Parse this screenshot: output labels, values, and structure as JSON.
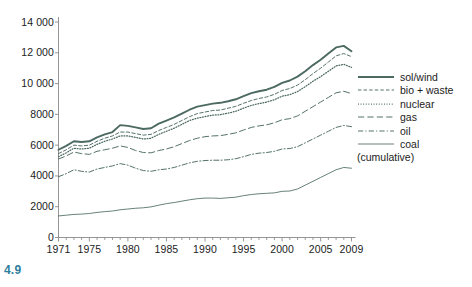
{
  "figure": {
    "number": "4.9",
    "number_color": "#2d7f9d",
    "line_color": "#4c6a62",
    "axis_color": "#8a8a8a",
    "text_color": "#1c1c1c"
  },
  "legend": {
    "position": "right",
    "note": "(cumulative)",
    "entries": [
      {
        "label": "sol/wind",
        "style": "solid-thick"
      },
      {
        "label": "bio + waste",
        "style": "dashed"
      },
      {
        "label": "nuclear",
        "style": "dotted"
      },
      {
        "label": "gas",
        "style": "long-dash"
      },
      {
        "label": "oil",
        "style": "dash-dot"
      },
      {
        "label": "coal",
        "style": "solid-thin"
      }
    ]
  },
  "chart_data": {
    "type": "line",
    "title": "",
    "subtitle": "",
    "xlabel": "",
    "ylabel": "",
    "cumulative": true,
    "grid": false,
    "legend_position": "right",
    "xlim": [
      1971,
      2009
    ],
    "ylim": [
      0,
      14000
    ],
    "yticks": [
      0,
      2000,
      4000,
      6000,
      8000,
      10000,
      12000,
      14000
    ],
    "ytick_labels": [
      "0",
      "2000",
      "4000",
      "6000",
      "8000",
      "10 000",
      "12 000",
      "14 000"
    ],
    "xticks": [
      1971,
      1975,
      1980,
      1985,
      1990,
      1995,
      2000,
      2005,
      2009
    ],
    "xtick_labels": [
      "1971",
      "1975",
      "1980",
      "1985",
      "1990",
      "1995",
      "2000",
      "2005",
      "2009"
    ],
    "x": [
      1971,
      1972,
      1973,
      1974,
      1975,
      1976,
      1977,
      1978,
      1979,
      1980,
      1981,
      1982,
      1983,
      1984,
      1985,
      1986,
      1987,
      1988,
      1989,
      1990,
      1991,
      1992,
      1993,
      1994,
      1995,
      1996,
      1997,
      1998,
      1999,
      2000,
      2001,
      2002,
      2003,
      2004,
      2005,
      2006,
      2007,
      2008,
      2009
    ],
    "series": [
      {
        "name": "coal",
        "style": "solid-thin",
        "values": [
          1400,
          1450,
          1500,
          1520,
          1560,
          1630,
          1680,
          1720,
          1800,
          1850,
          1900,
          1930,
          1990,
          2100,
          2200,
          2270,
          2360,
          2450,
          2520,
          2560,
          2560,
          2540,
          2580,
          2620,
          2720,
          2790,
          2840,
          2870,
          2900,
          3000,
          3020,
          3150,
          3400,
          3650,
          3900,
          4150,
          4400,
          4550,
          4500
        ]
      },
      {
        "name": "oil",
        "style": "dash-dot",
        "values": [
          3950,
          4150,
          4400,
          4300,
          4250,
          4450,
          4550,
          4650,
          4800,
          4700,
          4500,
          4350,
          4300,
          4400,
          4450,
          4550,
          4700,
          4850,
          4950,
          5000,
          5020,
          5020,
          5050,
          5120,
          5250,
          5400,
          5480,
          5520,
          5600,
          5750,
          5780,
          5900,
          6150,
          6400,
          6650,
          6900,
          7150,
          7280,
          7200
        ]
      },
      {
        "name": "gas",
        "style": "long-dash",
        "values": [
          5100,
          5300,
          5550,
          5450,
          5400,
          5600,
          5700,
          5800,
          5950,
          5850,
          5650,
          5520,
          5500,
          5650,
          5750,
          5900,
          6100,
          6300,
          6450,
          6550,
          6600,
          6620,
          6700,
          6800,
          6980,
          7150,
          7250,
          7320,
          7450,
          7650,
          7720,
          7900,
          8200,
          8500,
          8800,
          9100,
          9400,
          9500,
          9350
        ]
      },
      {
        "name": "nuclear",
        "style": "dotted",
        "values": [
          5250,
          5500,
          5800,
          5750,
          5800,
          6050,
          6250,
          6400,
          6600,
          6600,
          6500,
          6400,
          6450,
          6700,
          6900,
          7100,
          7350,
          7600,
          7750,
          7850,
          7950,
          7980,
          8080,
          8200,
          8400,
          8580,
          8700,
          8800,
          8950,
          9180,
          9280,
          9480,
          9800,
          10150,
          10450,
          10800,
          11150,
          11250,
          11050
        ]
      },
      {
        "name": "bio + waste",
        "style": "dashed",
        "values": [
          5450,
          5700,
          6000,
          5950,
          6000,
          6250,
          6450,
          6600,
          6850,
          6850,
          6750,
          6650,
          6700,
          6950,
          7150,
          7350,
          7600,
          7850,
          8050,
          8150,
          8250,
          8280,
          8400,
          8520,
          8720,
          8900,
          9030,
          9130,
          9300,
          9550,
          9680,
          9900,
          10250,
          10650,
          11000,
          11400,
          11800,
          11950,
          11750
        ]
      },
      {
        "name": "sol/wind",
        "style": "solid-thick",
        "values": [
          5700,
          5950,
          6250,
          6200,
          6250,
          6500,
          6700,
          6850,
          7300,
          7250,
          7150,
          7050,
          7100,
          7400,
          7600,
          7800,
          8050,
          8300,
          8500,
          8600,
          8700,
          8750,
          8850,
          8980,
          9180,
          9380,
          9500,
          9600,
          9780,
          10050,
          10200,
          10450,
          10800,
          11200,
          11550,
          11950,
          12350,
          12450,
          12100
        ]
      }
    ]
  }
}
